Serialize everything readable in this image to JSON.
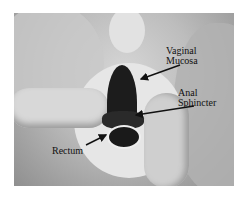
{
  "figure": {
    "type": "anatomical-photograph",
    "colors": {
      "background": "#ffffff",
      "tissue_light": "#d0d0d0",
      "tissue_dark": "#1a1a1a",
      "label": "#111111"
    },
    "labels": [
      {
        "id": "vaginal-mucosa",
        "lines": [
          "Vaginal",
          "Mucosa"
        ]
      },
      {
        "id": "anal-sphincter",
        "lines": [
          "Anal",
          "Sphincter"
        ]
      },
      {
        "id": "rectum",
        "lines": [
          "Rectum"
        ]
      }
    ]
  }
}
